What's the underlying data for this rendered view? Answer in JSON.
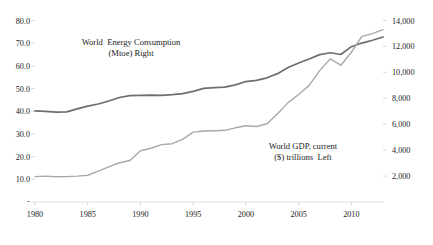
{
  "chart_data": {
    "type": "line",
    "title": "",
    "subtitle": "",
    "xlabel": "",
    "grid": false,
    "legend_position": "inline-annotations",
    "x": [
      1980,
      1981,
      1982,
      1983,
      1984,
      1985,
      1986,
      1987,
      1988,
      1989,
      1990,
      1991,
      1992,
      1993,
      1994,
      1995,
      1996,
      1997,
      1998,
      1999,
      2000,
      2001,
      2002,
      2003,
      2004,
      2005,
      2006,
      2007,
      2008,
      2009,
      2010,
      2011,
      2012,
      2013
    ],
    "x_ticks": [
      "1980",
      "1985",
      "1990",
      "1995",
      "2000",
      "2005",
      "2010"
    ],
    "axes": {
      "left": {
        "name": "World GDP, current ($) trillions",
        "ticks": [
          "-",
          "10.0",
          "20.0",
          "30.0",
          "40.0",
          "50.0",
          "60.0",
          "70.0",
          "80.0"
        ],
        "min": 0,
        "max": 80,
        "step": 10
      },
      "right": {
        "name": "World Energy Consumption (Mtoe)",
        "ticks": [
          "2,000",
          "4,000",
          "6,000",
          "8,000",
          "10,000",
          "12,000",
          "14,000"
        ],
        "min": 0,
        "max": 14000,
        "step": 2000
      }
    },
    "series": [
      {
        "name": "World Energy Consumption (Mtoe) Right",
        "axis": "right",
        "color": "#6e6e6e",
        "values": [
          7030,
          6990,
          6930,
          6950,
          7180,
          7400,
          7560,
          7790,
          8060,
          8200,
          8230,
          8240,
          8230,
          8280,
          8360,
          8530,
          8760,
          8830,
          8860,
          9030,
          9290,
          9380,
          9580,
          9900,
          10370,
          10720,
          11030,
          11370,
          11510,
          11380,
          11980,
          12260,
          12480,
          12730
        ]
      },
      {
        "name": "World GDP, current ($) trillions Left",
        "axis": "left",
        "color": "#a9a9a9",
        "values": [
          11.2,
          11.4,
          11.1,
          11.2,
          11.4,
          11.8,
          13.6,
          15.5,
          17.3,
          18.3,
          22.6,
          23.7,
          25.3,
          25.7,
          27.6,
          30.8,
          31.3,
          31.4,
          31.6,
          32.7,
          33.6,
          33.3,
          34.5,
          38.9,
          43.8,
          47.4,
          51.4,
          57.9,
          63.1,
          60.3,
          66.0,
          73.0,
          74.2,
          76.0
        ]
      }
    ],
    "annotations": [
      {
        "id": "energy-annotation",
        "line1": "World  Energy Consumption",
        "line2": "(Mtoe) Right",
        "x": 131,
        "y": 45
      },
      {
        "id": "gdp-annotation",
        "line1": "World GDP, current",
        "line2": "($) trillions  Left",
        "x": 303,
        "y": 149
      }
    ]
  }
}
